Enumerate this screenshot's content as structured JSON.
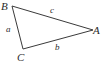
{
  "figure": {
    "kind": "geometry-diagram",
    "shape": "triangle",
    "background_color": "#ffffff",
    "stroke_color": "#3a3a3a",
    "stroke_width": 1,
    "text_color": "#2b2b2b",
    "canvas": {
      "width": 103,
      "height": 67
    }
  },
  "vertices": [
    {
      "id": "B",
      "label": "B",
      "x": 12,
      "y": 6,
      "label_x": 1,
      "label_y": 1
    },
    {
      "id": "A",
      "label": "A",
      "x": 93,
      "y": 30,
      "label_x": 93,
      "label_y": 25
    },
    {
      "id": "C",
      "label": "C",
      "x": 23,
      "y": 49,
      "label_x": 17,
      "label_y": 52
    }
  ],
  "sides": [
    {
      "id": "a",
      "label": "a",
      "from": "B",
      "to": "C",
      "label_x": 6,
      "label_y": 25
    },
    {
      "id": "b",
      "label": "b",
      "from": "C",
      "to": "A",
      "label_x": 55,
      "label_y": 43
    },
    {
      "id": "c",
      "label": "c",
      "from": "B",
      "to": "A",
      "label_x": 50,
      "label_y": 6
    }
  ],
  "polygon_points": "12,6 93,30 23,49"
}
